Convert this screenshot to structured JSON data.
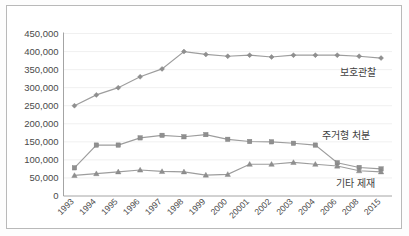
{
  "chart_data": {
    "type": "line",
    "title": "",
    "xlabel": "",
    "ylabel": "",
    "ylim": [
      0,
      450000
    ],
    "ytick_step": 50000,
    "grid": true,
    "legend_position": "inline-right",
    "ytick_labels": [
      "450,000",
      "400,000",
      "350,000",
      "300,000",
      "250,000",
      "200,000",
      "150,000",
      "100,000",
      "50,000",
      "0"
    ],
    "categories": [
      "1993",
      "1994",
      "1995",
      "1996",
      "1997",
      "1998",
      "1999",
      "2000",
      "20001",
      "2002",
      "2003",
      "2004",
      "2006",
      "2008",
      "2015"
    ],
    "series": [
      {
        "name": "보호관찰",
        "marker": "diamond",
        "color": "#8f8f8f",
        "values": [
          250000,
          280000,
          300000,
          330000,
          352000,
          400000,
          392000,
          387000,
          390000,
          385000,
          390000,
          390000,
          390000,
          387000,
          382000
        ]
      },
      {
        "name": "주거형 처분",
        "marker": "square",
        "color": "#8f8f8f",
        "values": [
          78000,
          141000,
          141000,
          161000,
          168000,
          164000,
          170000,
          157000,
          151000,
          150000,
          146000,
          141000,
          92000,
          79000,
          75000
        ]
      },
      {
        "name": "기타 제재",
        "marker": "triangle",
        "color": "#8f8f8f",
        "values": [
          57000,
          62000,
          67000,
          72000,
          68000,
          67000,
          58000,
          60000,
          88000,
          88000,
          93000,
          88000,
          83000,
          70000,
          67000
        ]
      }
    ],
    "series_label_positions": [
      {
        "name": "보호관찰",
        "x": 340,
        "y": 76
      },
      {
        "name": "주거형 처분",
        "x": 322,
        "y": 139
      },
      {
        "name": "기타 제재",
        "x": 336,
        "y": 187
      }
    ]
  },
  "axis": {
    "y_max": 450000,
    "y_min": 0
  }
}
